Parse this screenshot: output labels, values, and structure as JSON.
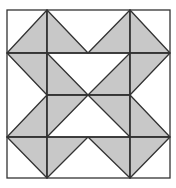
{
  "diagram": {
    "type": "quilt-block",
    "grid": {
      "cols": 4,
      "rows": 4,
      "x": [
        7,
        47,
        88,
        130,
        170
      ],
      "y": [
        10,
        53,
        95,
        137,
        178
      ]
    },
    "colors": {
      "fill": "#c8c8c8",
      "stroke": "#333333",
      "background": "#ffffff"
    },
    "shaded_triangles": [
      {
        "cell": "0,0",
        "pts": [
          [
            1,
            0
          ],
          [
            0,
            1
          ],
          [
            1,
            1
          ]
        ]
      },
      {
        "cell": "1,0",
        "pts": [
          [
            1,
            0
          ],
          [
            1,
            1
          ],
          [
            2,
            1
          ]
        ]
      },
      {
        "cell": "2,0",
        "pts": [
          [
            3,
            0
          ],
          [
            2,
            1
          ],
          [
            3,
            1
          ]
        ]
      },
      {
        "cell": "3,0",
        "pts": [
          [
            3,
            0
          ],
          [
            3,
            1
          ],
          [
            4,
            1
          ]
        ]
      },
      {
        "cell": "0,1",
        "pts": [
          [
            0,
            1
          ],
          [
            1,
            1
          ],
          [
            1,
            2
          ]
        ]
      },
      {
        "cell": "1,1",
        "pts": [
          [
            1,
            1
          ],
          [
            1,
            2
          ],
          [
            2,
            2
          ]
        ]
      },
      {
        "cell": "2,1",
        "pts": [
          [
            3,
            1
          ],
          [
            2,
            2
          ],
          [
            3,
            2
          ]
        ]
      },
      {
        "cell": "3,1",
        "pts": [
          [
            3,
            1
          ],
          [
            4,
            1
          ],
          [
            3,
            2
          ]
        ]
      },
      {
        "cell": "0,2",
        "pts": [
          [
            1,
            2
          ],
          [
            0,
            3
          ],
          [
            1,
            3
          ]
        ]
      },
      {
        "cell": "1,2",
        "pts": [
          [
            1,
            2
          ],
          [
            2,
            2
          ],
          [
            1,
            3
          ]
        ]
      },
      {
        "cell": "2,2",
        "pts": [
          [
            2,
            2
          ],
          [
            3,
            2
          ],
          [
            3,
            3
          ]
        ]
      },
      {
        "cell": "3,2",
        "pts": [
          [
            3,
            2
          ],
          [
            3,
            3
          ],
          [
            4,
            3
          ]
        ]
      },
      {
        "cell": "0,3",
        "pts": [
          [
            0,
            3
          ],
          [
            1,
            3
          ],
          [
            1,
            4
          ]
        ]
      },
      {
        "cell": "1,3",
        "pts": [
          [
            1,
            3
          ],
          [
            2,
            3
          ],
          [
            1,
            4
          ]
        ]
      },
      {
        "cell": "2,3",
        "pts": [
          [
            2,
            3
          ],
          [
            3,
            3
          ],
          [
            3,
            4
          ]
        ]
      },
      {
        "cell": "3,3",
        "pts": [
          [
            3,
            3
          ],
          [
            4,
            3
          ],
          [
            3,
            4
          ]
        ]
      }
    ],
    "lines": [
      {
        "from": [
          1,
          0
        ],
        "to": [
          1,
          4
        ]
      },
      {
        "from": [
          3,
          0
        ],
        "to": [
          3,
          4
        ]
      },
      {
        "from": [
          0,
          1
        ],
        "to": [
          4,
          1
        ]
      },
      {
        "from": [
          0,
          3
        ],
        "to": [
          4,
          3
        ]
      },
      {
        "from": [
          1,
          2
        ],
        "to": [
          3,
          2
        ]
      }
    ]
  }
}
